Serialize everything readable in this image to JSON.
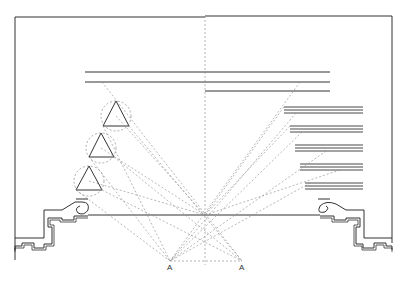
{
  "diagram": {
    "type": "theater sightline section",
    "colors": {
      "line": "#333333",
      "dashed": "#777777",
      "background": "#ffffff"
    },
    "labels": {
      "point_left": "A",
      "point_right": "A"
    },
    "elements": {
      "frame": "proscenium-outline",
      "upper_borders": 3,
      "right_borders": 5,
      "spotlights": 3,
      "stage_floor": "stage-floor-line",
      "sightline_origins": [
        "A",
        "A"
      ]
    }
  }
}
